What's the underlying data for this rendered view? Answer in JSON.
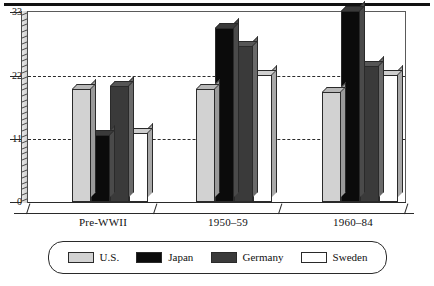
{
  "chart_data": {
    "type": "bar",
    "title": "",
    "subtitle": "",
    "xlabel": "",
    "ylabel": "",
    "categories": [
      "Pre-WWII",
      "1950–59",
      "1960–84"
    ],
    "series": [
      {
        "name": "U.S.",
        "color": "#d2d2d2",
        "values": [
          19.5,
          19.5,
          19.0
        ]
      },
      {
        "name": "Japan",
        "color": "#0b0b0b",
        "values": [
          11.5,
          30.0,
          33.0
        ]
      },
      {
        "name": "Germany",
        "color": "#3a3a3a",
        "values": [
          20.0,
          27.0,
          23.5
        ]
      },
      {
        "name": "Sweden",
        "color": "#ffffff",
        "values": [
          12.0,
          22.0,
          22.0
        ]
      }
    ],
    "ylim": [
      0,
      33
    ],
    "yticks": [
      0,
      11,
      22,
      33
    ],
    "ytick_labels": [
      "0",
      "11",
      "22",
      "33"
    ],
    "minor_tick_step": 1,
    "gridlines": [
      11,
      22
    ],
    "grid": true,
    "grid_style": "dashed",
    "legend_position": "bottom",
    "style": "3d-bar"
  },
  "axis": {
    "y_labels": [
      "33",
      "22",
      "11",
      "0"
    ]
  },
  "categories": {
    "c0": "Pre-WWII",
    "c1": "1950–59",
    "c2": "1960–84"
  },
  "legend": {
    "items": [
      {
        "label": "U.S."
      },
      {
        "label": "Japan"
      },
      {
        "label": "Germany"
      },
      {
        "label": "Sweden"
      }
    ]
  }
}
